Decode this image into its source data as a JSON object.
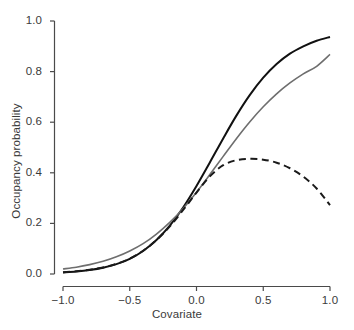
{
  "chart_data": {
    "type": "line",
    "title": "",
    "subtitle": "",
    "xlabel": "Covariate",
    "ylabel": "Occupancy probability",
    "xlim": [
      -1.0,
      1.0
    ],
    "ylim": [
      0.0,
      1.0
    ],
    "xticks": [
      "-1.0",
      "-0.5",
      "0.0",
      "0.5",
      "1.0"
    ],
    "xtick_values": [
      -1.0,
      -0.5,
      0.0,
      0.5,
      1.0
    ],
    "yticks": [
      "0.0",
      "0.2",
      "0.4",
      "0.6",
      "0.8",
      "1.0"
    ],
    "ytick_values": [
      0.0,
      0.2,
      0.4,
      0.6,
      0.8,
      1.0
    ],
    "grid": false,
    "legend": "none",
    "x": [
      -1.0,
      -0.9,
      -0.8,
      -0.7,
      -0.6,
      -0.5,
      -0.4,
      -0.3,
      -0.2,
      -0.1,
      0.0,
      0.1,
      0.2,
      0.3,
      0.4,
      0.5,
      0.6,
      0.7,
      0.8,
      0.9,
      1.0
    ],
    "series": [
      {
        "name": "black-solid-curve",
        "style": "solid",
        "color": "#111111",
        "width": 2.0,
        "values": [
          0.006,
          0.01,
          0.016,
          0.025,
          0.039,
          0.06,
          0.091,
          0.134,
          0.191,
          0.263,
          0.348,
          0.441,
          0.536,
          0.627,
          0.708,
          0.776,
          0.83,
          0.871,
          0.9,
          0.922,
          0.937
        ]
      },
      {
        "name": "gray-solid-curve",
        "style": "solid",
        "color": "#6e6e6e",
        "width": 1.6,
        "values": [
          0.02,
          0.027,
          0.037,
          0.05,
          0.068,
          0.091,
          0.12,
          0.158,
          0.204,
          0.259,
          0.323,
          0.393,
          0.465,
          0.536,
          0.602,
          0.661,
          0.712,
          0.755,
          0.791,
          0.821,
          0.868
        ]
      },
      {
        "name": "black-dashed-curve",
        "style": "dashed",
        "color": "#1a1a1a",
        "width": 2.0,
        "values": [
          0.007,
          0.011,
          0.017,
          0.026,
          0.04,
          0.061,
          0.092,
          0.134,
          0.188,
          0.253,
          0.322,
          0.386,
          0.43,
          0.45,
          0.455,
          0.452,
          0.44,
          0.418,
          0.385,
          0.338,
          0.272
        ]
      }
    ],
    "annotations": []
  },
  "axes": {
    "x_title": "Covariate",
    "y_title": "Occupancy probability"
  }
}
